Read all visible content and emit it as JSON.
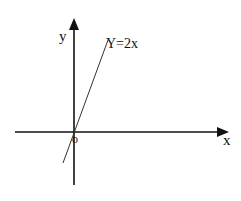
{
  "diagram": {
    "type": "coordinate-plane",
    "axes": {
      "x_label": "x",
      "y_label": "y",
      "origin_label": "o"
    },
    "line": {
      "equation_label": "Y=2x",
      "slope": 2,
      "intercept": 0
    },
    "colors": {
      "axis": "#111111",
      "line": "#333333",
      "background": "#ffffff"
    }
  }
}
